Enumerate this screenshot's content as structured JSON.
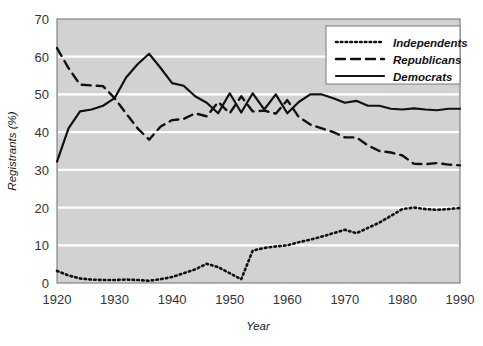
{
  "chart_data": {
    "type": "line",
    "title": "",
    "xlabel": "Year",
    "ylabel": "Registrants (%)",
    "xlim": [
      1920,
      1990
    ],
    "ylim": [
      0,
      70
    ],
    "xticks": [
      1920,
      1930,
      1940,
      1950,
      1960,
      1970,
      1980,
      1990
    ],
    "yticks": [
      0,
      10,
      20,
      30,
      40,
      50,
      60,
      70
    ],
    "grid": "horizontal-white",
    "plot_background": "#d2d2d2",
    "legend_position": "top-right",
    "series": [
      {
        "name": "Independents",
        "style": "dotted",
        "color": "#111111",
        "x": [
          1920,
          1922,
          1924,
          1926,
          1928,
          1930,
          1932,
          1934,
          1936,
          1938,
          1940,
          1942,
          1944,
          1946,
          1948,
          1950,
          1952,
          1954,
          1956,
          1958,
          1960,
          1962,
          1964,
          1966,
          1968,
          1970,
          1972,
          1974,
          1976,
          1978,
          1980,
          1982,
          1984,
          1986,
          1988,
          1990
        ],
        "values": [
          3.2,
          2.0,
          1.2,
          0.9,
          0.8,
          0.8,
          0.9,
          0.8,
          0.6,
          1.0,
          1.6,
          2.6,
          3.6,
          5.1,
          4.2,
          2.6,
          1.0,
          8.6,
          9.3,
          9.7,
          10.0,
          10.8,
          11.5,
          12.3,
          13.2,
          14.1,
          13.2,
          14.6,
          16.0,
          17.8,
          19.6,
          20.0,
          19.6,
          19.4,
          19.6,
          19.9
        ]
      },
      {
        "name": "Republicans",
        "style": "dashed",
        "color": "#111111",
        "x": [
          1920,
          1922,
          1924,
          1926,
          1928,
          1930,
          1932,
          1934,
          1936,
          1938,
          1940,
          1942,
          1944,
          1946,
          1948,
          1950,
          1952,
          1954,
          1956,
          1958,
          1960,
          1962,
          1964,
          1966,
          1968,
          1970,
          1972,
          1974,
          1976,
          1978,
          1980,
          1982,
          1984,
          1986,
          1988,
          1990
        ],
        "values": [
          62.3,
          57.0,
          52.6,
          52.4,
          52.2,
          49.0,
          45.0,
          41.0,
          38.0,
          41.5,
          43.2,
          43.5,
          45.0,
          44.2,
          48.0,
          45.0,
          49.5,
          45.5,
          45.7,
          44.9,
          48.5,
          44.0,
          42.0,
          41.0,
          40.0,
          38.6,
          38.6,
          36.5,
          35.0,
          34.6,
          33.8,
          31.6,
          31.5,
          31.8,
          31.4,
          31.2
        ]
      },
      {
        "name": "Democrats",
        "style": "solid",
        "color": "#111111",
        "x": [
          1920,
          1922,
          1924,
          1926,
          1928,
          1930,
          1932,
          1934,
          1936,
          1938,
          1940,
          1942,
          1944,
          1946,
          1948,
          1950,
          1952,
          1954,
          1956,
          1958,
          1960,
          1962,
          1964,
          1966,
          1968,
          1970,
          1972,
          1974,
          1976,
          1978,
          1980,
          1982,
          1984,
          1986,
          1988,
          1990
        ],
        "values": [
          32.2,
          41.0,
          45.5,
          46.0,
          47.0,
          49.0,
          54.5,
          58.0,
          60.8,
          57.0,
          53.0,
          52.3,
          49.5,
          47.8,
          45.0,
          50.3,
          45.2,
          50.3,
          46.0,
          50.0,
          45.0,
          48.0,
          50.0,
          50.0,
          49.0,
          47.8,
          48.3,
          47.0,
          47.0,
          46.2,
          46.0,
          46.3,
          46.0,
          45.8,
          46.2,
          46.2
        ]
      }
    ]
  },
  "legend": {
    "items": [
      {
        "label": "Independents",
        "style": "dotted"
      },
      {
        "label": "Republicans",
        "style": "dashed"
      },
      {
        "label": "Democrats",
        "style": "solid"
      }
    ]
  }
}
